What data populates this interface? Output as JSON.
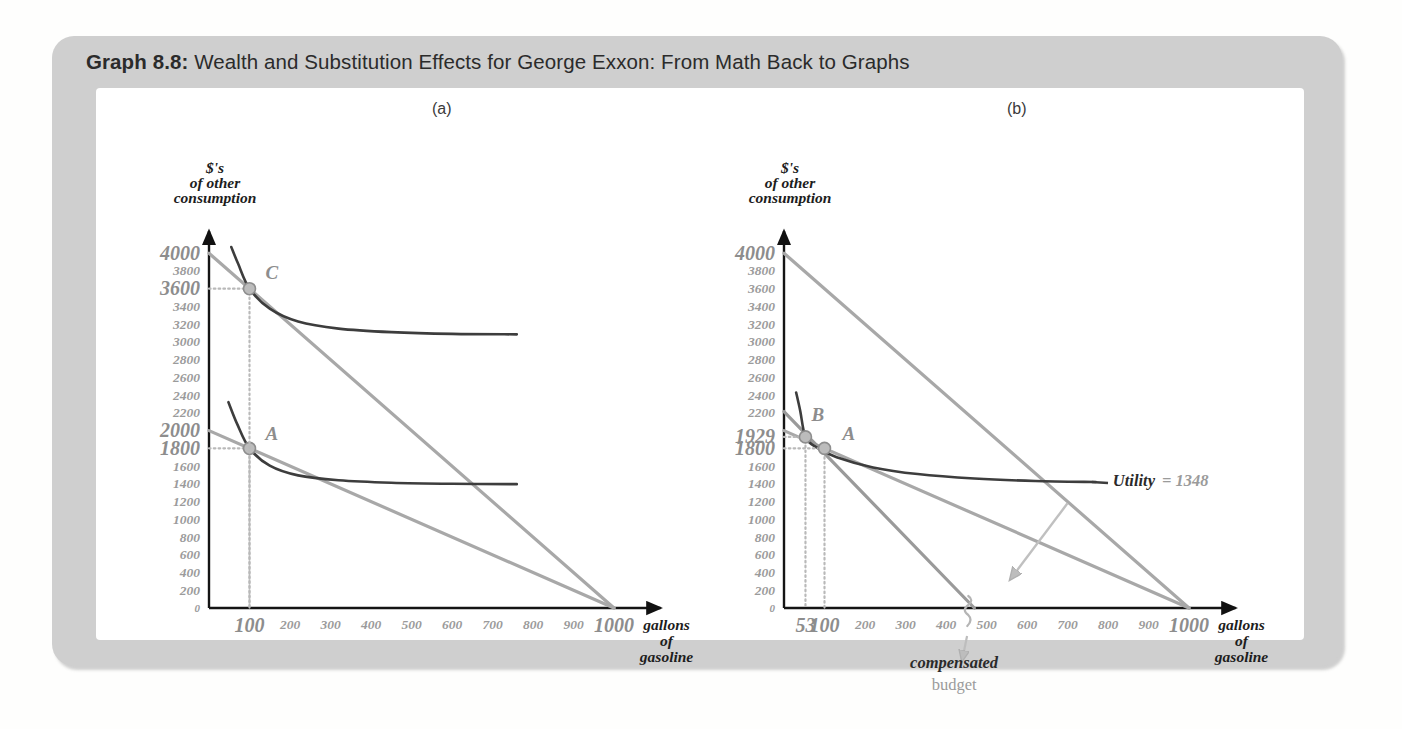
{
  "figure": {
    "number": "Graph 8.8:",
    "title": "Wealth and Substitution Effects for George Exxon: From Math Back to Graphs",
    "panel_a_label": "(a)",
    "panel_b_label": "(b)"
  },
  "axes": {
    "ylabel_line1": "$'s",
    "ylabel_line2": "of other",
    "ylabel_line3": "consumption",
    "xlabel_line1": "gallons",
    "xlabel_line2": "of",
    "xlabel_line3": "gasoline",
    "zero": "0"
  },
  "annotations": {
    "utility_name": "Utility",
    "utility_value": "= 1348",
    "compensated_bold": "compensated",
    "compensated_plain": "budget"
  },
  "chart_data": [
    {
      "type": "line",
      "panel": "(a)",
      "title": "Wealth effect: shift from bundle A to bundle C",
      "xlabel": "gallons of gasoline",
      "ylabel": "$'s of other consumption",
      "xlim": [
        0,
        1100
      ],
      "ylim": [
        0,
        4200
      ],
      "grid": false,
      "legend": "none",
      "x_ticks": [
        100,
        200,
        300,
        400,
        500,
        600,
        700,
        800,
        900,
        1000
      ],
      "x_ticks_emphasized": [
        100,
        1000
      ],
      "y_ticks": [
        200,
        400,
        600,
        800,
        1000,
        1200,
        1400,
        1600,
        1800,
        2000,
        2200,
        2400,
        2600,
        2800,
        3000,
        3200,
        3400,
        3600,
        3800,
        4000
      ],
      "y_ticks_emphasized": [
        1800,
        2000,
        3600,
        4000
      ],
      "series": [
        {
          "name": "original budget (price $2/gallon)",
          "kind": "budget-line",
          "color": "#a8a8a8",
          "x": [
            0,
            1000
          ],
          "values": [
            2000,
            0
          ]
        },
        {
          "name": "new budget (price $4/gallon, income 4000)",
          "kind": "budget-line",
          "color": "#a8a8a8",
          "x": [
            0,
            1000
          ],
          "values": [
            4000,
            0
          ]
        },
        {
          "name": "indifference curve through A",
          "kind": "indifference-curve",
          "color": "#3d3d3d",
          "tangency_point": "A",
          "x": [
            48,
            70,
            100,
            150,
            220,
            320,
            450,
            600,
            760
          ],
          "values": [
            2320,
            2070,
            1800,
            1605,
            1495,
            1440,
            1412,
            1400,
            1396
          ]
        },
        {
          "name": "indifference curve through C",
          "kind": "indifference-curve",
          "color": "#3d3d3d",
          "tangency_point": "C",
          "x": [
            55,
            72,
            100,
            150,
            220,
            320,
            450,
            600,
            760
          ],
          "values": [
            4070,
            3880,
            3600,
            3375,
            3230,
            3150,
            3110,
            3090,
            3085
          ]
        }
      ],
      "points": [
        {
          "label": "A",
          "x": 100,
          "y": 1800
        },
        {
          "label": "C",
          "x": 100,
          "y": 3600
        }
      ]
    },
    {
      "type": "line",
      "panel": "(b)",
      "title": "Substitution effect: shift from bundle A to bundle B on compensated budget",
      "xlabel": "gallons of gasoline",
      "ylabel": "$'s of other consumption",
      "xlim": [
        0,
        1100
      ],
      "ylim": [
        0,
        4200
      ],
      "grid": false,
      "legend": "none",
      "x_ticks": [
        53,
        100,
        200,
        300,
        400,
        500,
        600,
        700,
        800,
        900,
        1000
      ],
      "x_ticks_emphasized": [
        53,
        100,
        1000
      ],
      "y_ticks": [
        200,
        400,
        600,
        800,
        1000,
        1200,
        1400,
        1600,
        1800,
        1929,
        2200,
        2400,
        2600,
        2800,
        3000,
        3200,
        3400,
        3600,
        3800,
        4000
      ],
      "y_ticks_emphasized": [
        1800,
        1929,
        4000
      ],
      "series": [
        {
          "name": "original budget (price $2/gallon)",
          "kind": "budget-line",
          "color": "#a8a8a8",
          "x": [
            0,
            1000
          ],
          "values": [
            2000,
            0
          ]
        },
        {
          "name": "new budget (price $4/gallon, income 4000)",
          "kind": "budget-line",
          "color": "#a8a8a8",
          "x": [
            0,
            1000
          ],
          "values": [
            4000,
            0
          ]
        },
        {
          "name": "compensated budget",
          "kind": "budget-line",
          "color": "#9a9a9a",
          "x": [
            0,
            470
          ],
          "values": [
            2215,
            0
          ]
        },
        {
          "name": "indifference curve (Utility = 1348)",
          "kind": "indifference-curve",
          "color": "#3d3d3d",
          "tangency_point": "B",
          "x": [
            30,
            40,
            53,
            80,
            130,
            220,
            330,
            470,
            620,
            770
          ],
          "values": [
            2430,
            2225,
            1929,
            1810,
            1700,
            1585,
            1510,
            1460,
            1432,
            1420
          ]
        }
      ],
      "points": [
        {
          "label": "B",
          "x": 53,
          "y": 1929
        },
        {
          "label": "A",
          "x": 100,
          "y": 1800
        }
      ]
    }
  ]
}
